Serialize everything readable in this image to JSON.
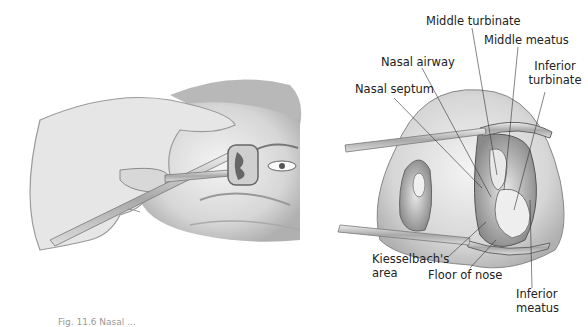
{
  "figure": {
    "left_panel": {
      "description": "Hand inserting nasal speculum into patient's nostril"
    },
    "right_panel": {
      "description": "Speculum view of nasal cavity anatomy"
    },
    "labels": {
      "middle_turbinate": "Middle turbinate",
      "middle_meatus": "Middle meatus",
      "nasal_airway": "Nasal airway",
      "inferior_turbinate_1": "Inferior",
      "inferior_turbinate_2": "turbinate",
      "nasal_septum": "Nasal septum",
      "kiesselbach_1": "Kiesselbach's",
      "kiesselbach_2": "area",
      "floor_of_nose": "Floor of nose",
      "inferior_meatus_1": "Inferior",
      "inferior_meatus_2": "meatus"
    },
    "caption_fragment": "Fig. 11.6  Nasal ..."
  }
}
